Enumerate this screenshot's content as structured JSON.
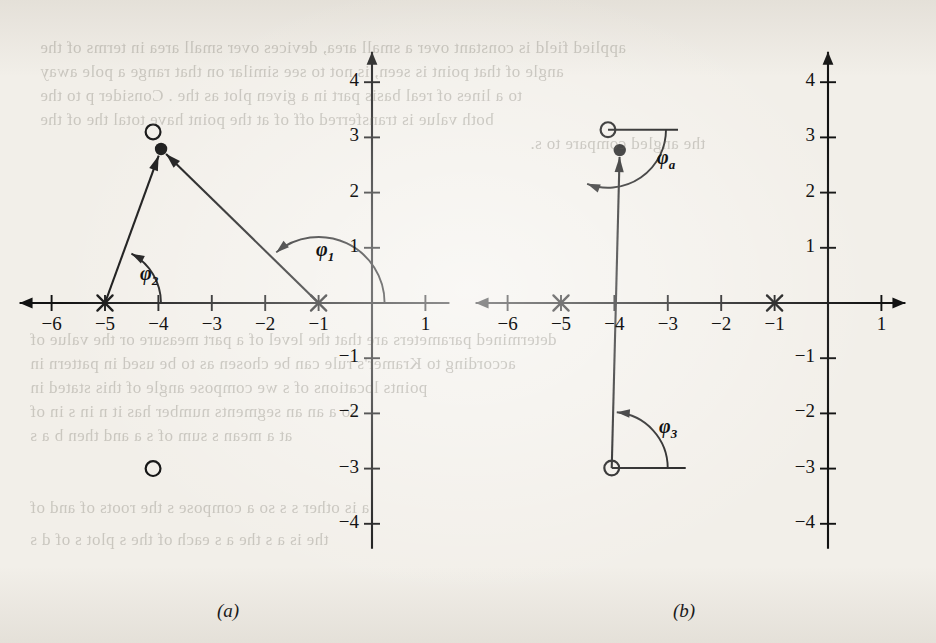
{
  "figure": {
    "background_color": "#f2efe9",
    "ink_color": "#121212",
    "panels": [
      {
        "id": "a",
        "caption": "(a)",
        "caption_px": [
          228,
          600
        ],
        "origin_px": [
          372,
          303
        ],
        "unit_px_x": 53.4,
        "unit_px_y": 55.2,
        "x_axis": {
          "label": "",
          "ticks": [
            -6,
            -5,
            -4,
            -3,
            -2,
            -1,
            1
          ],
          "tick_labels": [
            "−6",
            "−5",
            "−4",
            "−3",
            "−2",
            "−1",
            "1"
          ],
          "range": [
            -6.6,
            1.45
          ],
          "arrow_left": true,
          "arrow_right": false
        },
        "y_axis": {
          "label": "",
          "ticks": [
            4,
            3,
            2,
            1,
            -1,
            -2,
            -3,
            -4
          ],
          "tick_labels": [
            "4",
            "3",
            "2",
            "1",
            "−1",
            "−2",
            "−3",
            "−4"
          ],
          "range": [
            -4.45,
            4.55
          ],
          "arrow_up": true
        },
        "poles": [
          {
            "marker": "x",
            "x": -5,
            "y": 0
          },
          {
            "marker": "x",
            "x": -1,
            "y": 0
          }
        ],
        "zeros": [
          {
            "marker": "o",
            "x": -4.1,
            "y": 3.1
          },
          {
            "marker": "o",
            "x": -4.1,
            "y": -3.0
          }
        ],
        "test_point": {
          "marker": "filled-dot",
          "x": -3.95,
          "y": 2.79
        },
        "vectors": [
          {
            "from": [
              -5,
              0
            ],
            "to": [
              -3.95,
              2.79
            ],
            "arrow": "end"
          },
          {
            "from": [
              -1,
              0
            ],
            "to": [
              -3.95,
              2.79
            ],
            "arrow": "end"
          }
        ],
        "angle_arcs": [
          {
            "label": "φ",
            "sub": "1",
            "vertex": [
              -1,
              0
            ],
            "from_deg": 0,
            "to_deg": 136,
            "label_px": [
              316,
              238
            ]
          },
          {
            "label": "φ",
            "sub": "2",
            "vertex": [
              -5,
              0
            ],
            "from_deg": 0,
            "to_deg": 69,
            "label_px": [
              140,
              262
            ]
          }
        ]
      },
      {
        "id": "b",
        "caption": "(b)",
        "caption_px": [
          684,
          600
        ],
        "origin_px": [
          828,
          303
        ],
        "unit_px_x": 53.4,
        "unit_px_y": 55.2,
        "x_axis": {
          "label": "",
          "ticks": [
            -6,
            -5,
            -4,
            -3,
            -2,
            -1,
            1
          ],
          "tick_labels": [
            "−6",
            "−5",
            "−4",
            "−3",
            "−2",
            "−1",
            "1"
          ],
          "range": [
            -6.6,
            1.45
          ],
          "arrow_left": true,
          "arrow_right": true
        },
        "y_axis": {
          "label": "",
          "ticks": [
            4,
            3,
            2,
            1,
            -1,
            -2,
            -3,
            -4
          ],
          "tick_labels": [
            "4",
            "3",
            "2",
            "1",
            "−1",
            "−2",
            "−3",
            "−4"
          ],
          "range": [
            -4.45,
            4.55
          ],
          "arrow_up": true
        },
        "poles": [
          {
            "marker": "x",
            "x": -5,
            "y": 0
          },
          {
            "marker": "x",
            "x": -1,
            "y": 0
          }
        ],
        "zeros": [
          {
            "marker": "o",
            "x": -4.12,
            "y": 3.14
          },
          {
            "marker": "o",
            "x": -4.05,
            "y": -2.99
          }
        ],
        "test_point": {
          "marker": "filled-dot",
          "x": -3.9,
          "y": 2.77
        },
        "vectors": [
          {
            "from": [
              -4.05,
              -2.99
            ],
            "to": [
              -3.9,
              2.77
            ],
            "arrow": "end"
          }
        ],
        "angle_arcs": [
          {
            "label": "φ",
            "sub": "a",
            "vertex": [
              -4.12,
              3.14
            ],
            "from_deg": 0,
            "to_deg": -118,
            "label_px": [
              657,
              146
            ]
          },
          {
            "label": "φ",
            "sub": "3",
            "vertex": [
              -4.05,
              -2.99
            ],
            "from_deg": 0,
            "to_deg": 92,
            "label_px": [
              659,
              415
            ]
          }
        ]
      }
    ]
  },
  "bleedthrough_text": [
    {
      "text": "applied field is constant over a small area, devices over small area in terms of the",
      "px": [
        40,
        38
      ]
    },
    {
      "text": "angle of that point is seen, is not to see similar on that range a  pole away",
      "px": [
        40,
        62
      ]
    },
    {
      "text": "to a lines of real basis part  in a given plot as the . Consider  p  to the",
      "px": [
        40,
        86
      ]
    },
    {
      "text": "both value is transferred off of at the point have        total          the  of  the",
      "px": [
        40,
        110
      ]
    },
    {
      "text": "the angled compare to  s.",
      "px": [
        530,
        134
      ]
    },
    {
      "text": "determined parameters are that the level of a  part measure or the  value of",
      "px": [
        30,
        330
      ]
    },
    {
      "text": "according to Kramer's  rule  can be  chosen  as to  be used  in  pattern  in",
      "px": [
        30,
        354
      ]
    },
    {
      "text": "points locations of  s  we  compose  angle of this  stated in",
      "px": [
        30,
        378
      ]
    },
    {
      "text": "so a  an  an  segments  number  has  it  n  in  s  in  of",
      "px": [
        30,
        402
      ]
    },
    {
      "text": "at  a    mean  s  sum of    s a    and  then  b   a  s",
      "px": [
        30,
        426
      ]
    },
    {
      "text": "a  is  other  s  s  so  a  compose      s     the  roots  of  and  of",
      "px": [
        30,
        498
      ]
    },
    {
      "text": "the  is  a  s  the  a   s   each  of  the  s  plot  s  of  d  s",
      "px": [
        30,
        530
      ]
    }
  ]
}
